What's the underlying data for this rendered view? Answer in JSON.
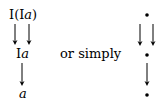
{
  "left_diagram": {
    "top_label_prefix": "I(I",
    "top_label_var": "a",
    "top_label_suffix": ")",
    "middle_label_prefix": "I",
    "middle_label_var": "a",
    "bottom_label_var": "a"
  },
  "connector_text": "or simply",
  "right_diagram": {
    "node_symbol": "•"
  }
}
